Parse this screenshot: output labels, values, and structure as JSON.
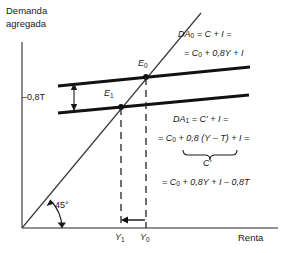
{
  "figure": {
    "type": "keynesian-cross-diagram",
    "language": "es",
    "axes": {
      "y_label_line1": "Demanda",
      "y_label_line2": "agregada",
      "x_label": "Renta"
    },
    "angle_label": "45°",
    "shift_label": "–0,8T",
    "equilibria": [
      {
        "name": "E",
        "sub": "0"
      },
      {
        "name": "E",
        "sub": "1"
      }
    ],
    "x_ticks": [
      {
        "name": "Y",
        "sub": "1"
      },
      {
        "name": "Y",
        "sub": "0"
      }
    ],
    "equations": {
      "da0": {
        "line1": {
          "lhs": "DA",
          "lhs_sub": "0",
          "rhs": "= C + I ="
        },
        "line2": {
          "text": "= C",
          "sub": "0",
          "rest": "+ 0,8Y + I"
        }
      },
      "da1": {
        "line1": {
          "lhs": "DA",
          "lhs_sub": "1",
          "rhs": "= C′ + I ="
        },
        "line2": {
          "text": "= C",
          "sub": "0",
          "rest": "+ 0,8 (Y – T) + I ="
        },
        "brace_label": "C′",
        "line3": {
          "text": "= C",
          "sub": "0",
          "rest": "+ 0,8Y + I – 0,8T"
        }
      }
    },
    "colors": {
      "ink": "#1a1a1a",
      "axis": "#6e6e6e",
      "line": "#111111",
      "dash": "#222222"
    }
  }
}
